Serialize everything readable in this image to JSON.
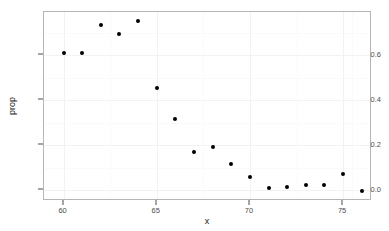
{
  "chart_data": {
    "type": "scatter",
    "title": "",
    "xlabel": "x",
    "ylabel": "prop",
    "xlim": [
      58.95,
      76.55
    ],
    "ylim": [
      -0.048,
      0.792
    ],
    "xticks": [
      60,
      65,
      70,
      75
    ],
    "xtick_labels": [
      "60",
      "65",
      "70",
      "75"
    ],
    "yticks": [
      0.0,
      0.2,
      0.4,
      0.6
    ],
    "ytick_labels": [
      "0.0",
      "0.2",
      "0.4",
      "0.6"
    ],
    "x_minor_ticks": [
      62.5,
      67.5,
      72.5,
      75.5
    ],
    "y_minor_ticks": [
      0.1,
      0.3,
      0.5,
      0.7
    ],
    "grid": true,
    "legend": false,
    "point_color": "#000000",
    "panel_border_color": "#b5b5b5",
    "grid_major_color": "#f2f2f2",
    "grid_minor_color": "#fafafa",
    "background_color": "#ffffff",
    "x": [
      60,
      61,
      62,
      63,
      64,
      65,
      66,
      67,
      68,
      69,
      70,
      71,
      72,
      73,
      74,
      75,
      76
    ],
    "y": [
      0.61,
      0.61,
      0.735,
      0.695,
      0.75,
      0.455,
      0.315,
      0.17,
      0.19,
      0.115,
      0.06,
      0.01,
      0.015,
      0.025,
      0.025,
      0.07,
      -0.005
    ],
    "points": [
      {
        "x": 60,
        "y": 0.61
      },
      {
        "x": 61,
        "y": 0.61
      },
      {
        "x": 62,
        "y": 0.735
      },
      {
        "x": 63,
        "y": 0.695
      },
      {
        "x": 64,
        "y": 0.75
      },
      {
        "x": 65,
        "y": 0.455
      },
      {
        "x": 66,
        "y": 0.315
      },
      {
        "x": 67,
        "y": 0.17
      },
      {
        "x": 68,
        "y": 0.19
      },
      {
        "x": 69,
        "y": 0.115
      },
      {
        "x": 70,
        "y": 0.06
      },
      {
        "x": 71,
        "y": 0.01
      },
      {
        "x": 72,
        "y": 0.015
      },
      {
        "x": 73,
        "y": 0.025
      },
      {
        "x": 74,
        "y": 0.025
      },
      {
        "x": 75,
        "y": 0.07
      },
      {
        "x": 76,
        "y": -0.005
      }
    ]
  }
}
